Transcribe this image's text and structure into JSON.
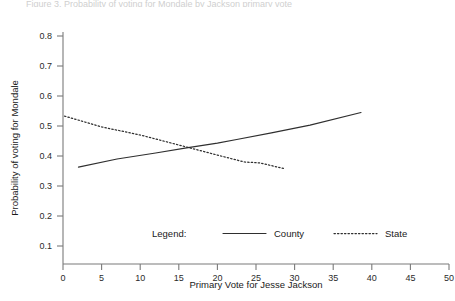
{
  "figure": {
    "clipped_caption": "Figure 3. Probability of voting for Mondale by Jackson primary vote"
  },
  "axes": {
    "x_title": "Primary Vote for Jesse Jackson",
    "y_title": "Probability of voting for Mondale",
    "x_ticks": [
      "0",
      "5",
      "10",
      "15",
      "20",
      "25",
      "30",
      "35",
      "40",
      "45",
      "50"
    ],
    "y_ticks": [
      "0.1",
      "0.2",
      "0.3",
      "0.4",
      "0.5",
      "0.6",
      "0.7",
      "0.8"
    ]
  },
  "legend": {
    "title": "Legend:",
    "entries": [
      {
        "label": "County",
        "style": "solid",
        "color": "#2f2f2f"
      },
      {
        "label": "State",
        "style": "dotted",
        "color": "#2f2f2f"
      }
    ]
  },
  "chart_data": {
    "type": "line",
    "title": "",
    "xlabel": "Primary Vote for Jesse Jackson",
    "ylabel": "Probability of voting for Mondale",
    "xlim": [
      0,
      50
    ],
    "ylim": [
      0.1,
      0.8
    ],
    "xticks": [
      0,
      5,
      10,
      15,
      20,
      25,
      30,
      35,
      40,
      45,
      50
    ],
    "yticks": [
      0.1,
      0.2,
      0.3,
      0.4,
      0.5,
      0.6,
      0.7,
      0.8
    ],
    "grid": false,
    "legend_position": "lower-center",
    "series": [
      {
        "name": "County",
        "style": "solid",
        "color": "#2f2f2f",
        "points": [
          [
            2.0,
            0.363
          ],
          [
            7.0,
            0.39
          ],
          [
            12.0,
            0.41
          ],
          [
            16.0,
            0.427
          ],
          [
            20.0,
            0.443
          ],
          [
            22.5,
            0.455
          ],
          [
            27.0,
            0.477
          ],
          [
            32.0,
            0.503
          ],
          [
            38.6,
            0.545
          ]
        ]
      },
      {
        "name": "State",
        "style": "dotted",
        "color": "#2f2f2f",
        "points": [
          [
            0.2,
            0.533
          ],
          [
            5.0,
            0.497
          ],
          [
            10.0,
            0.47
          ],
          [
            16.0,
            0.43
          ],
          [
            20.0,
            0.403
          ],
          [
            23.5,
            0.38
          ],
          [
            25.5,
            0.377
          ],
          [
            28.8,
            0.357
          ]
        ]
      }
    ]
  }
}
